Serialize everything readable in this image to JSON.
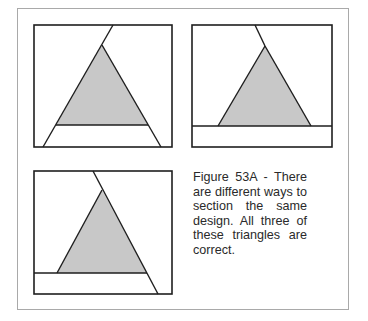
{
  "figure": {
    "caption": "Figure 53A - There are different ways to section the same design. All three of these triangles are correct.",
    "colors": {
      "stroke": "#1e1e1e",
      "triangle_fill": "#c8c8c8",
      "frame_border": "#a9a9a9",
      "background": "#ffffff"
    },
    "panels": [
      {
        "name": "panel-1",
        "description": "triangle with base section line spanning between diagonal lines, apex line continuing up-right"
      },
      {
        "name": "panel-2",
        "description": "triangle sitting on full-width horizontal section line, apex line continuing up-left"
      },
      {
        "name": "panel-3",
        "description": "triangle with left-extended base line, right side continuing to bottom edge"
      }
    ]
  }
}
